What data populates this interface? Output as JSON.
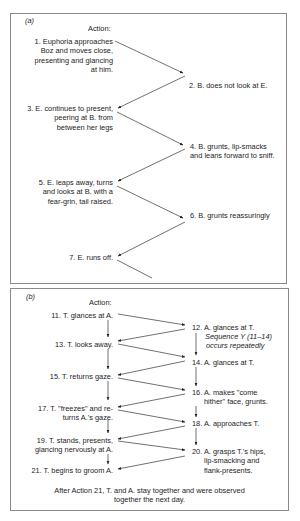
{
  "panel_a": {
    "label": "(a)",
    "heading": "Action:",
    "actions": [
      {
        "lines": [
          "1. Euphoria approaches",
          "Boz and moves close,",
          "presenting and glancing",
          "at him."
        ]
      },
      {
        "lines": [
          "2. B. does not look at E."
        ]
      },
      {
        "lines": [
          "3. E. continues to present,",
          "peering at B. from",
          "between her legs"
        ]
      },
      {
        "lines": [
          "4. B. grunts, lip-smacks",
          "and leans forward to sniff."
        ]
      },
      {
        "lines": [
          "5. E. leaps away, turns",
          "and looks at B. with a",
          "fear-grin, tail raised."
        ]
      },
      {
        "lines": [
          "6. B. grunts reassuringly"
        ]
      },
      {
        "lines": [
          "7. E. runs off."
        ]
      }
    ]
  },
  "panel_b": {
    "label": "(b)",
    "heading": "Action:",
    "left_actions": [
      {
        "lines": [
          "11. T. glances at A."
        ]
      },
      {
        "lines": [
          "13. T. looks away."
        ]
      },
      {
        "lines": [
          "15. T. returns gaze."
        ]
      },
      {
        "lines": [
          "17. T. \"freezes\" and re-",
          "turns A.'s gaze."
        ]
      },
      {
        "lines": [
          "19. T. stands, presents,",
          "glancing nervously at A."
        ]
      },
      {
        "lines": [
          "21. T. begins to groom A."
        ]
      }
    ],
    "right_actions": [
      {
        "lines": [
          "12. A. glances at T."
        ]
      },
      {
        "lines": [
          "14. A. glances at T."
        ]
      },
      {
        "lines": [
          "16. A. makes \"come",
          "hither\" face, grunts."
        ]
      },
      {
        "lines": [
          "18. A. approaches T."
        ]
      },
      {
        "lines": [
          "20. A. grasps T.'s hips,",
          "lip-smacking and",
          "flank-presents."
        ]
      }
    ],
    "sequence_note": [
      "Sequence Y (11–14)",
      "occurs repeatedly"
    ],
    "footer": [
      "After Action 21, T. and A. stay together and were observed",
      "together the next day."
    ]
  },
  "colors": {
    "text": "#1c1c1c",
    "border": "#8a8a8a",
    "arrow": "#333333"
  }
}
